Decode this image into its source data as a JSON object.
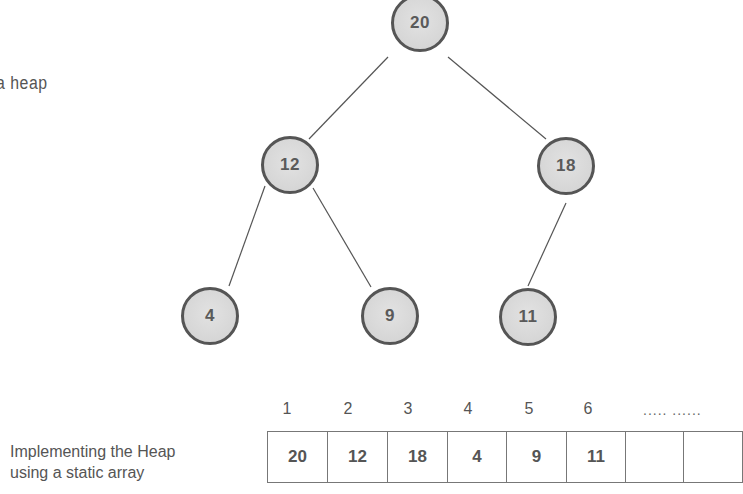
{
  "captions": {
    "tree_caption": "a heap",
    "array_caption_line1": "Implementing the Heap",
    "array_caption_line2": "using a static array"
  },
  "tree": {
    "nodes": [
      {
        "id": "n1",
        "value": "20",
        "x": 420,
        "y": 23
      },
      {
        "id": "n2",
        "value": "12",
        "x": 290,
        "y": 165
      },
      {
        "id": "n3",
        "value": "18",
        "x": 566,
        "y": 166
      },
      {
        "id": "n4",
        "value": "4",
        "x": 210,
        "y": 316
      },
      {
        "id": "n5",
        "value": "9",
        "x": 390,
        "y": 316
      },
      {
        "id": "n6",
        "value": "11",
        "x": 528,
        "y": 317
      }
    ],
    "edges": [
      {
        "from": "n1",
        "to": "n2"
      },
      {
        "from": "n1",
        "to": "n3"
      },
      {
        "from": "n2",
        "to": "n4"
      },
      {
        "from": "n2",
        "to": "n5"
      },
      {
        "from": "n3",
        "to": "n6"
      }
    ]
  },
  "array": {
    "indices": [
      "1",
      "2",
      "3",
      "4",
      "5",
      "6"
    ],
    "ellipsis": "..... ......",
    "cells": [
      "20",
      "12",
      "18",
      "4",
      "9",
      "11",
      "",
      ""
    ],
    "cell_widths": [
      60,
      60,
      60,
      59,
      60,
      59,
      58,
      59
    ]
  },
  "colors": {
    "node_fill": "#d8d8d8",
    "node_border": "#555555",
    "edge": "#555555",
    "text": "#555555",
    "background": "#ffffff"
  }
}
